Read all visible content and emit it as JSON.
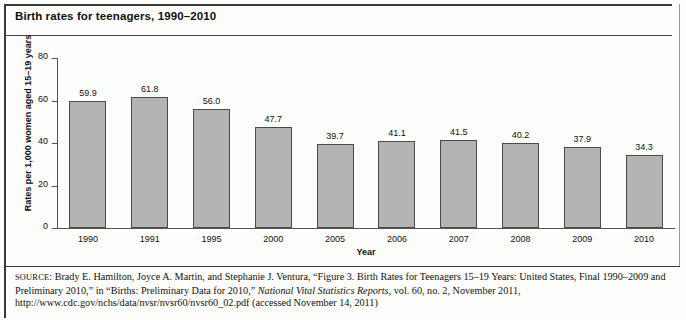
{
  "figure": {
    "title": "Birth rates for teenagers, 1990–2010"
  },
  "chart_data": {
    "type": "bar",
    "title": "Birth rates for teenagers, 1990–2010",
    "xlabel": "Year",
    "ylabel": "Rates per 1,000 women aged 15–19 years",
    "categories": [
      "1990",
      "1991",
      "1995",
      "2000",
      "2005",
      "2006",
      "2007",
      "2008",
      "2009",
      "2010"
    ],
    "values": [
      59.9,
      61.8,
      56.0,
      47.7,
      39.7,
      41.1,
      41.5,
      40.2,
      37.9,
      34.3
    ],
    "value_labels": [
      "59.9",
      "61.8",
      "56.0",
      "47.7",
      "39.7",
      "41.1",
      "41.5",
      "40.2",
      "37.9",
      "34.3"
    ],
    "ylim": [
      0,
      80
    ],
    "yticks": [
      0,
      20,
      40,
      60,
      80
    ],
    "ytick_labels": [
      "0",
      "20",
      "40",
      "60",
      "80"
    ],
    "grid": false,
    "legend": false,
    "bar_color": "#b4b4b4",
    "bar_border_color": "#4a4a4a"
  },
  "source": {
    "label": "SOURCE",
    "line1_a": ": Brady E. Hamilton, Joyce A. Martin, and Stephanie J. Ventura, “Figure 3. Birth Rates for Teenagers 15–19 Years: United States, Final 1990–2009 and Preliminary 2010,” in “Births: Preliminary Data for 2010,” ",
    "italic": "National Vital Statistics Reports",
    "line1_b": ", vol. 60, no. 2, November 2011, http://www.cdc.gov/nchs/data/nvsr/nvsr60/nvsr60_02.pdf (accessed November 14, 2011)"
  }
}
